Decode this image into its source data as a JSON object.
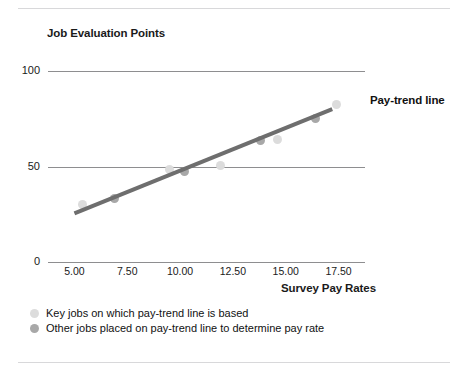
{
  "chart_data": {
    "type": "scatter",
    "title": "",
    "ylabel": "Job Evaluation Points",
    "xlabel": "Survey Pay Rates",
    "xlim": [
      3.75,
      18.75
    ],
    "ylim": [
      0,
      100
    ],
    "grid": true,
    "xticks": [
      "5.00",
      "7.50",
      "10.00",
      "12.50",
      "15.00",
      "17.50"
    ],
    "xtick_values": [
      5.0,
      7.5,
      10.0,
      12.5,
      15.0,
      17.5
    ],
    "yticks": [
      "100",
      "50",
      "0"
    ],
    "ytick_values": [
      100,
      50,
      0
    ],
    "series": [
      {
        "name": "Pay-trend line",
        "type": "line",
        "color": "#6e6e6e",
        "x": [
          5.0,
          17.2
        ],
        "y": [
          25.5,
          80.0
        ]
      },
      {
        "name": "Key jobs on which pay-trend line is based",
        "type": "scatter",
        "color": "#dcdcdc",
        "points": [
          {
            "x": 5.4,
            "y": 30.0
          },
          {
            "x": 9.5,
            "y": 48.5
          },
          {
            "x": 11.9,
            "y": 50.5
          },
          {
            "x": 14.6,
            "y": 64.0
          },
          {
            "x": 17.4,
            "y": 82.5
          }
        ]
      },
      {
        "name": "Other jobs placed on pay-trend line to determine pay rate",
        "type": "scatter",
        "color": "#a8a8a8",
        "points": [
          {
            "x": 6.9,
            "y": 33.5
          },
          {
            "x": 10.2,
            "y": 47.5
          },
          {
            "x": 13.8,
            "y": 63.5
          },
          {
            "x": 16.4,
            "y": 75.0
          }
        ]
      }
    ],
    "annotations": [
      {
        "text": "Pay-trend line",
        "x": 17.9,
        "y": 74.0
      }
    ],
    "legend": {
      "position": "below-axis",
      "entries": [
        {
          "label": "Key jobs on which pay-trend line is based",
          "color": "#dcdcdc"
        },
        {
          "label": "Other jobs placed on pay-trend line to determine pay rate",
          "color": "#a8a8a8"
        }
      ]
    }
  },
  "figure": {
    "y_caption": "Job Evaluation Points",
    "x_caption": "Survey Pay Rates",
    "trend_label": "Pay-trend line"
  }
}
